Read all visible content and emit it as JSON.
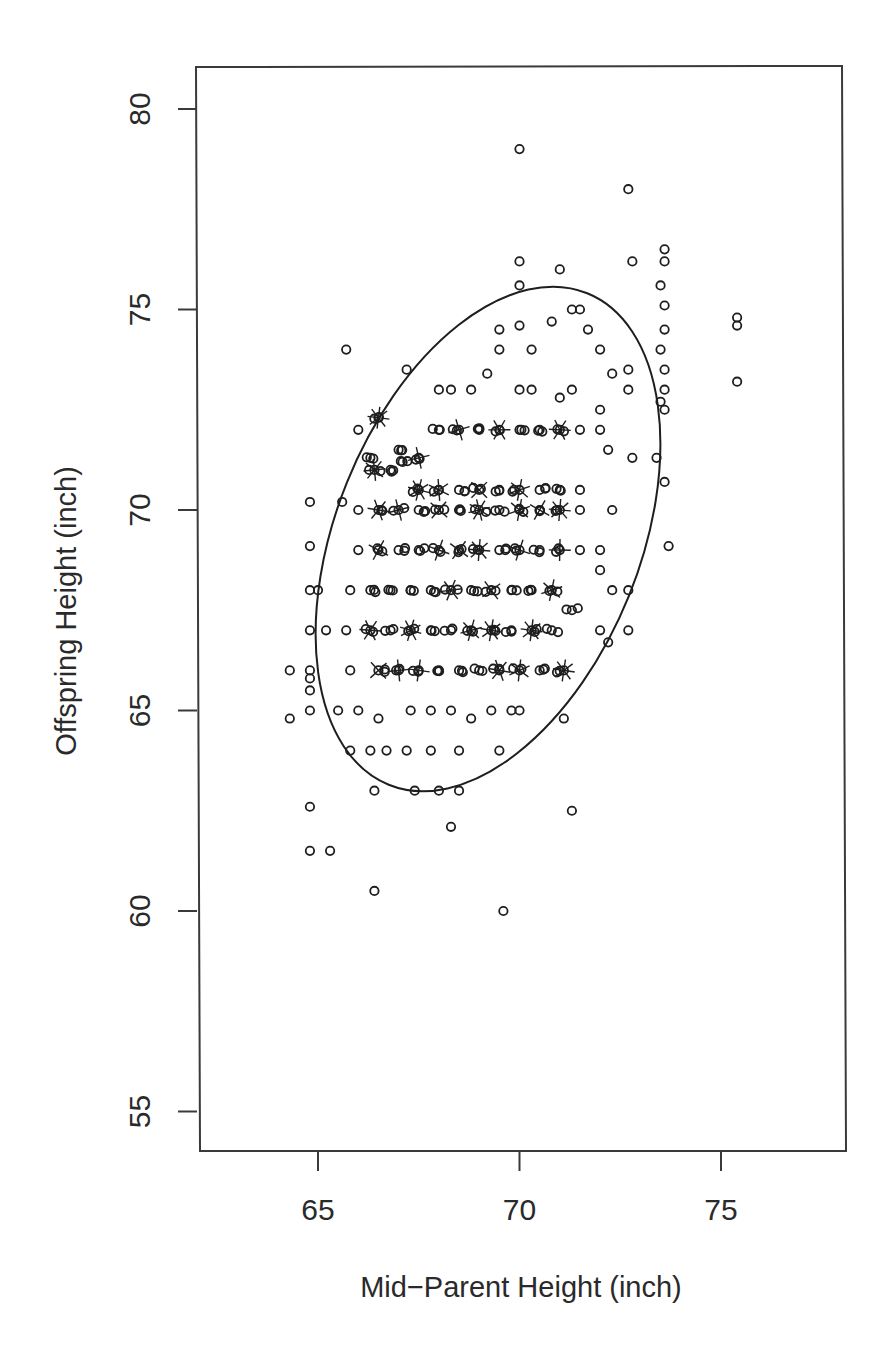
{
  "chart_data": {
    "type": "scatter",
    "title": "",
    "xlabel": "Mid−Parent Height (inch)",
    "ylabel": "Offspring Height (inch)",
    "xlim": [
      62.9,
      78.9
    ],
    "ylim": [
      54.0,
      81.0
    ],
    "xticks": [
      65,
      70,
      75
    ],
    "yticks": [
      55,
      60,
      65,
      70,
      75,
      80
    ],
    "grid": false,
    "legend": null,
    "marker": "open-circle",
    "annotations": [
      "sunflower petals mark overplotted points",
      "confidence ellipse"
    ],
    "ellipse": {
      "center": [
        69.2,
        69.3
      ],
      "x_range": [
        64.85,
        73.6
      ],
      "y_range": [
        62.9,
        75.6
      ]
    },
    "points": [
      [
        70.0,
        79.0
      ],
      [
        72.7,
        78.0
      ],
      [
        72.8,
        76.2
      ],
      [
        70.0,
        76.2
      ],
      [
        73.6,
        76.5
      ],
      [
        73.6,
        76.2
      ],
      [
        70.0,
        75.6
      ],
      [
        73.5,
        75.6
      ],
      [
        71.0,
        76.0
      ],
      [
        73.6,
        75.1
      ],
      [
        71.3,
        75.0
      ],
      [
        71.5,
        75.0
      ],
      [
        70.0,
        74.6
      ],
      [
        69.5,
        74.5
      ],
      [
        70.8,
        74.7
      ],
      [
        71.7,
        74.5
      ],
      [
        73.6,
        74.5
      ],
      [
        75.4,
        74.8
      ],
      [
        75.4,
        74.6
      ],
      [
        75.4,
        73.2
      ],
      [
        65.7,
        74.0
      ],
      [
        67.2,
        73.5
      ],
      [
        69.5,
        74.0
      ],
      [
        70.3,
        74.0
      ],
      [
        72.0,
        74.0
      ],
      [
        73.5,
        74.0
      ],
      [
        73.6,
        73.5
      ],
      [
        72.7,
        73.0
      ],
      [
        72.7,
        73.5
      ],
      [
        73.6,
        73.0
      ],
      [
        73.5,
        72.7
      ],
      [
        73.6,
        72.5
      ],
      [
        68.0,
        73.0
      ],
      [
        68.3,
        73.0
      ],
      [
        68.8,
        73.0
      ],
      [
        69.2,
        73.4
      ],
      [
        70.0,
        73.0
      ],
      [
        70.3,
        73.0
      ],
      [
        71.0,
        72.8
      ],
      [
        71.3,
        73.0
      ],
      [
        72.3,
        73.4
      ],
      [
        72.0,
        72.5
      ],
      [
        66.0,
        72.0
      ],
      [
        66.5,
        72.3
      ],
      [
        67.0,
        71.5
      ],
      [
        66.3,
        71.3
      ],
      [
        66.4,
        71.0
      ],
      [
        66.8,
        71.0
      ],
      [
        67.1,
        71.2
      ],
      [
        67.5,
        71.3
      ],
      [
        68.0,
        72.0
      ],
      [
        68.5,
        72.0
      ],
      [
        69.0,
        72.0
      ],
      [
        69.5,
        72.0
      ],
      [
        70.0,
        72.0
      ],
      [
        70.5,
        72.0
      ],
      [
        71.0,
        72.0
      ],
      [
        71.5,
        72.0
      ],
      [
        72.0,
        72.0
      ],
      [
        72.2,
        71.5
      ],
      [
        72.8,
        71.3
      ],
      [
        73.4,
        71.3
      ],
      [
        73.6,
        70.7
      ],
      [
        73.7,
        69.1
      ],
      [
        72.3,
        70.0
      ],
      [
        72.0,
        69.0
      ],
      [
        72.0,
        68.5
      ],
      [
        72.3,
        68.0
      ],
      [
        72.7,
        68.0
      ],
      [
        72.7,
        67.0
      ],
      [
        72.0,
        67.0
      ],
      [
        72.2,
        66.7
      ],
      [
        67.5,
        70.5
      ],
      [
        68.0,
        70.5
      ],
      [
        68.5,
        70.5
      ],
      [
        69.0,
        70.5
      ],
      [
        69.5,
        70.5
      ],
      [
        70.0,
        70.5
      ],
      [
        70.5,
        70.5
      ],
      [
        71.0,
        70.5
      ],
      [
        71.5,
        70.5
      ],
      [
        65.6,
        70.2
      ],
      [
        66.0,
        70.0
      ],
      [
        66.5,
        70.0
      ],
      [
        67.0,
        70.0
      ],
      [
        67.5,
        70.0
      ],
      [
        68.0,
        70.0
      ],
      [
        68.5,
        70.0
      ],
      [
        69.0,
        70.0
      ],
      [
        69.5,
        70.0
      ],
      [
        70.0,
        70.0
      ],
      [
        70.5,
        70.0
      ],
      [
        71.0,
        70.0
      ],
      [
        71.5,
        70.0
      ],
      [
        64.8,
        70.2
      ],
      [
        64.8,
        69.1
      ],
      [
        66.0,
        69.0
      ],
      [
        66.5,
        69.0
      ],
      [
        67.0,
        69.0
      ],
      [
        67.5,
        69.0
      ],
      [
        68.0,
        69.0
      ],
      [
        68.5,
        69.0
      ],
      [
        69.0,
        69.0
      ],
      [
        69.5,
        69.0
      ],
      [
        70.0,
        69.0
      ],
      [
        70.5,
        69.0
      ],
      [
        71.0,
        69.0
      ],
      [
        71.5,
        69.0
      ],
      [
        64.8,
        68.0
      ],
      [
        65.0,
        68.0
      ],
      [
        65.8,
        68.0
      ],
      [
        66.3,
        68.0
      ],
      [
        66.8,
        68.0
      ],
      [
        67.3,
        68.0
      ],
      [
        67.8,
        68.0
      ],
      [
        68.3,
        68.0
      ],
      [
        68.8,
        68.0
      ],
      [
        69.3,
        68.0
      ],
      [
        69.8,
        68.0
      ],
      [
        70.3,
        68.0
      ],
      [
        70.8,
        68.0
      ],
      [
        71.3,
        67.5
      ],
      [
        64.8,
        67.0
      ],
      [
        65.2,
        67.0
      ],
      [
        65.7,
        67.0
      ],
      [
        66.3,
        67.0
      ],
      [
        66.8,
        67.0
      ],
      [
        67.3,
        67.0
      ],
      [
        67.8,
        67.0
      ],
      [
        68.3,
        67.0
      ],
      [
        68.8,
        67.0
      ],
      [
        69.3,
        67.0
      ],
      [
        69.8,
        67.0
      ],
      [
        70.3,
        67.0
      ],
      [
        70.8,
        67.0
      ],
      [
        64.3,
        66.0
      ],
      [
        64.8,
        66.0
      ],
      [
        64.8,
        65.8
      ],
      [
        64.8,
        65.5
      ],
      [
        65.8,
        66.0
      ],
      [
        66.5,
        66.0
      ],
      [
        67.0,
        66.0
      ],
      [
        67.5,
        66.0
      ],
      [
        68.0,
        66.0
      ],
      [
        68.5,
        66.0
      ],
      [
        69.0,
        66.0
      ],
      [
        69.5,
        66.0
      ],
      [
        70.0,
        66.0
      ],
      [
        70.5,
        66.0
      ],
      [
        71.1,
        66.0
      ],
      [
        64.3,
        64.8
      ],
      [
        64.8,
        65.0
      ],
      [
        65.5,
        65.0
      ],
      [
        66.0,
        65.0
      ],
      [
        66.5,
        64.8
      ],
      [
        67.3,
        65.0
      ],
      [
        67.8,
        65.0
      ],
      [
        68.3,
        65.0
      ],
      [
        68.8,
        64.8
      ],
      [
        69.3,
        65.0
      ],
      [
        69.8,
        65.0
      ],
      [
        70.0,
        65.0
      ],
      [
        71.1,
        64.8
      ],
      [
        65.8,
        64.0
      ],
      [
        66.3,
        64.0
      ],
      [
        66.7,
        64.0
      ],
      [
        67.2,
        64.0
      ],
      [
        67.8,
        64.0
      ],
      [
        68.5,
        64.0
      ],
      [
        69.5,
        64.0
      ],
      [
        66.4,
        63.0
      ],
      [
        67.4,
        63.0
      ],
      [
        68.0,
        63.0
      ],
      [
        68.5,
        63.0
      ],
      [
        64.8,
        62.6
      ],
      [
        71.3,
        62.5
      ],
      [
        68.3,
        62.1
      ],
      [
        64.8,
        61.5
      ],
      [
        65.3,
        61.5
      ],
      [
        66.4,
        60.5
      ],
      [
        69.6,
        60.0
      ]
    ]
  },
  "plot": {
    "frame_color": "#3a3a3a",
    "marker_color": "#1e1e1e",
    "ellipse_color": "#1e1e1e"
  }
}
